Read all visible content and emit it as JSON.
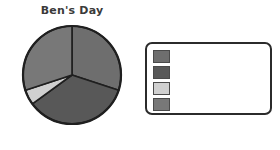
{
  "chart_data": {
    "type": "pie",
    "title": "Ben's Day",
    "categories": [
      "Slice 1",
      "Slice 2",
      "Slice 3",
      "Slice 4"
    ],
    "values": [
      30,
      35,
      5,
      30
    ],
    "labels": [
      "",
      "",
      "",
      ""
    ],
    "colors": [
      "#6e6e6e",
      "#585858",
      "#d0d0d0",
      "#787878"
    ],
    "start_angle": 0,
    "direction": "clockwise",
    "legend": {
      "position": "right",
      "box_border_color": "#2b2b2b",
      "entries": [
        {
          "color": "#6e6e6e",
          "label": ""
        },
        {
          "color": "#585858",
          "label": ""
        },
        {
          "color": "#d0d0d0",
          "label": ""
        },
        {
          "color": "#787878",
          "label": ""
        }
      ]
    },
    "grid": false,
    "xlabel": "",
    "ylabel": ""
  },
  "chart": {
    "title": "Ben's Day",
    "outline_color": "#1f1f1f",
    "background": "#ffffff"
  }
}
